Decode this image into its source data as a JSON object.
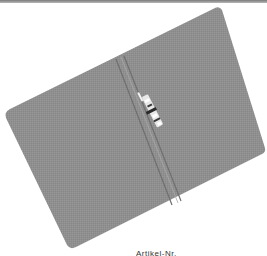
{
  "image": {
    "subject": "grey folder with metal fastener clip",
    "colors": {
      "folder": "#8f8f8f",
      "folder_shadow": "#7f7f7f",
      "spine": "#6e6e6e",
      "clip": "#e6e6e6",
      "clip_dark": "#2a2a2a",
      "background": "#ffffff",
      "top_bar": "#8a8a8a"
    }
  },
  "caption": {
    "text": "Artikel-Nr."
  }
}
